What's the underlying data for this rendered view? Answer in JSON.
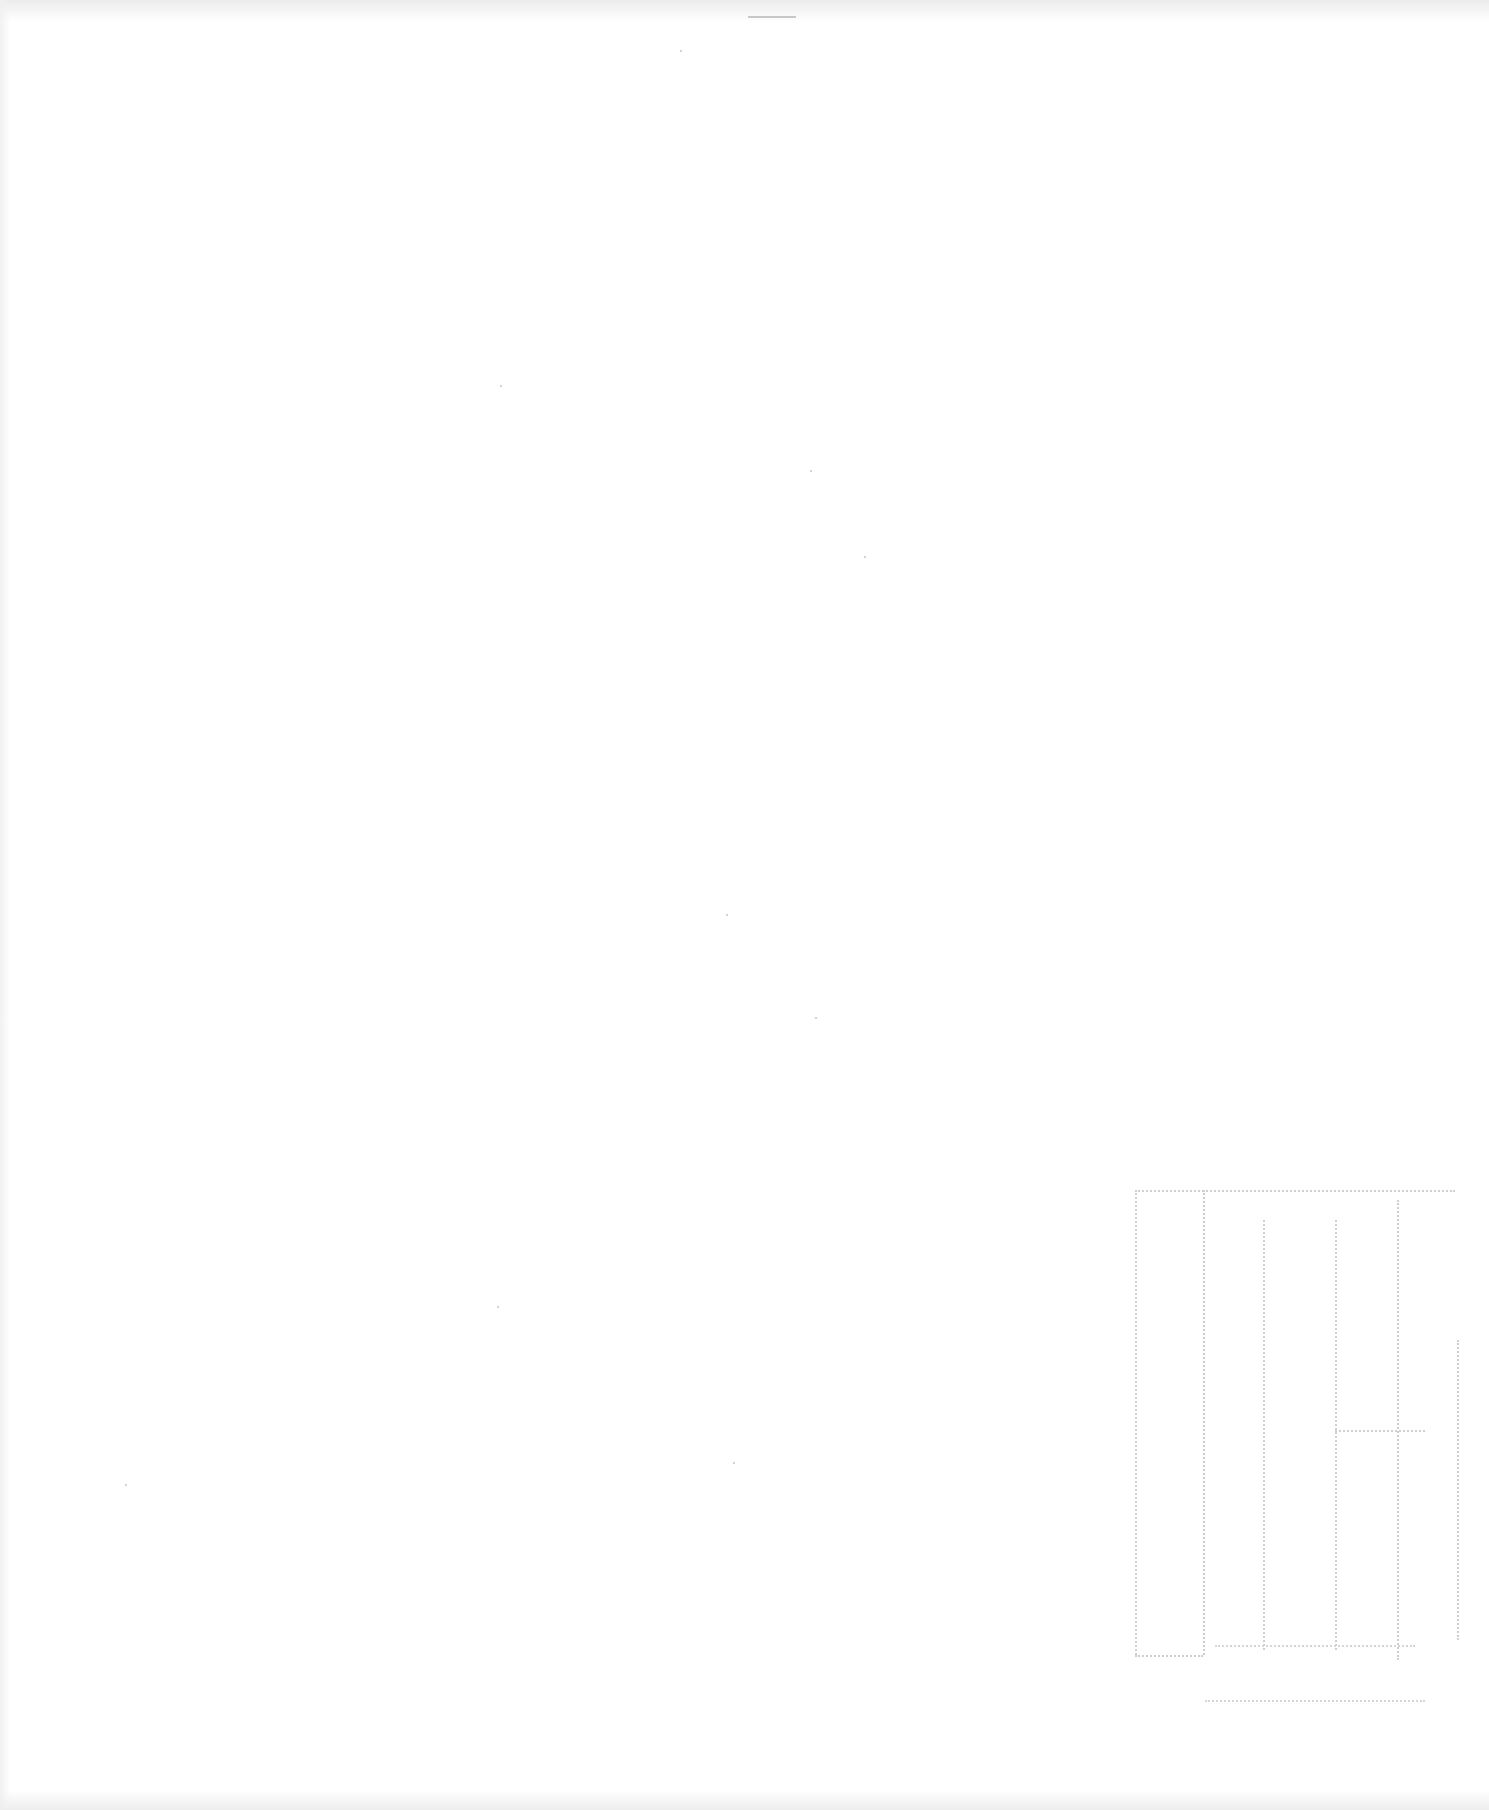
{
  "page": {
    "type": "scanned-blank-page",
    "background_color": "#ffffff",
    "visible_text": []
  },
  "artifacts": {
    "form_outline": {
      "description": "faint dotted bleed-through grid in lower right",
      "line_color": "#cfcfcf"
    },
    "bleed_lines": [
      {
        "x": 1205,
        "y": 1645,
        "w": 210
      },
      {
        "x": 1205,
        "y": 1700,
        "w": 220
      }
    ]
  }
}
